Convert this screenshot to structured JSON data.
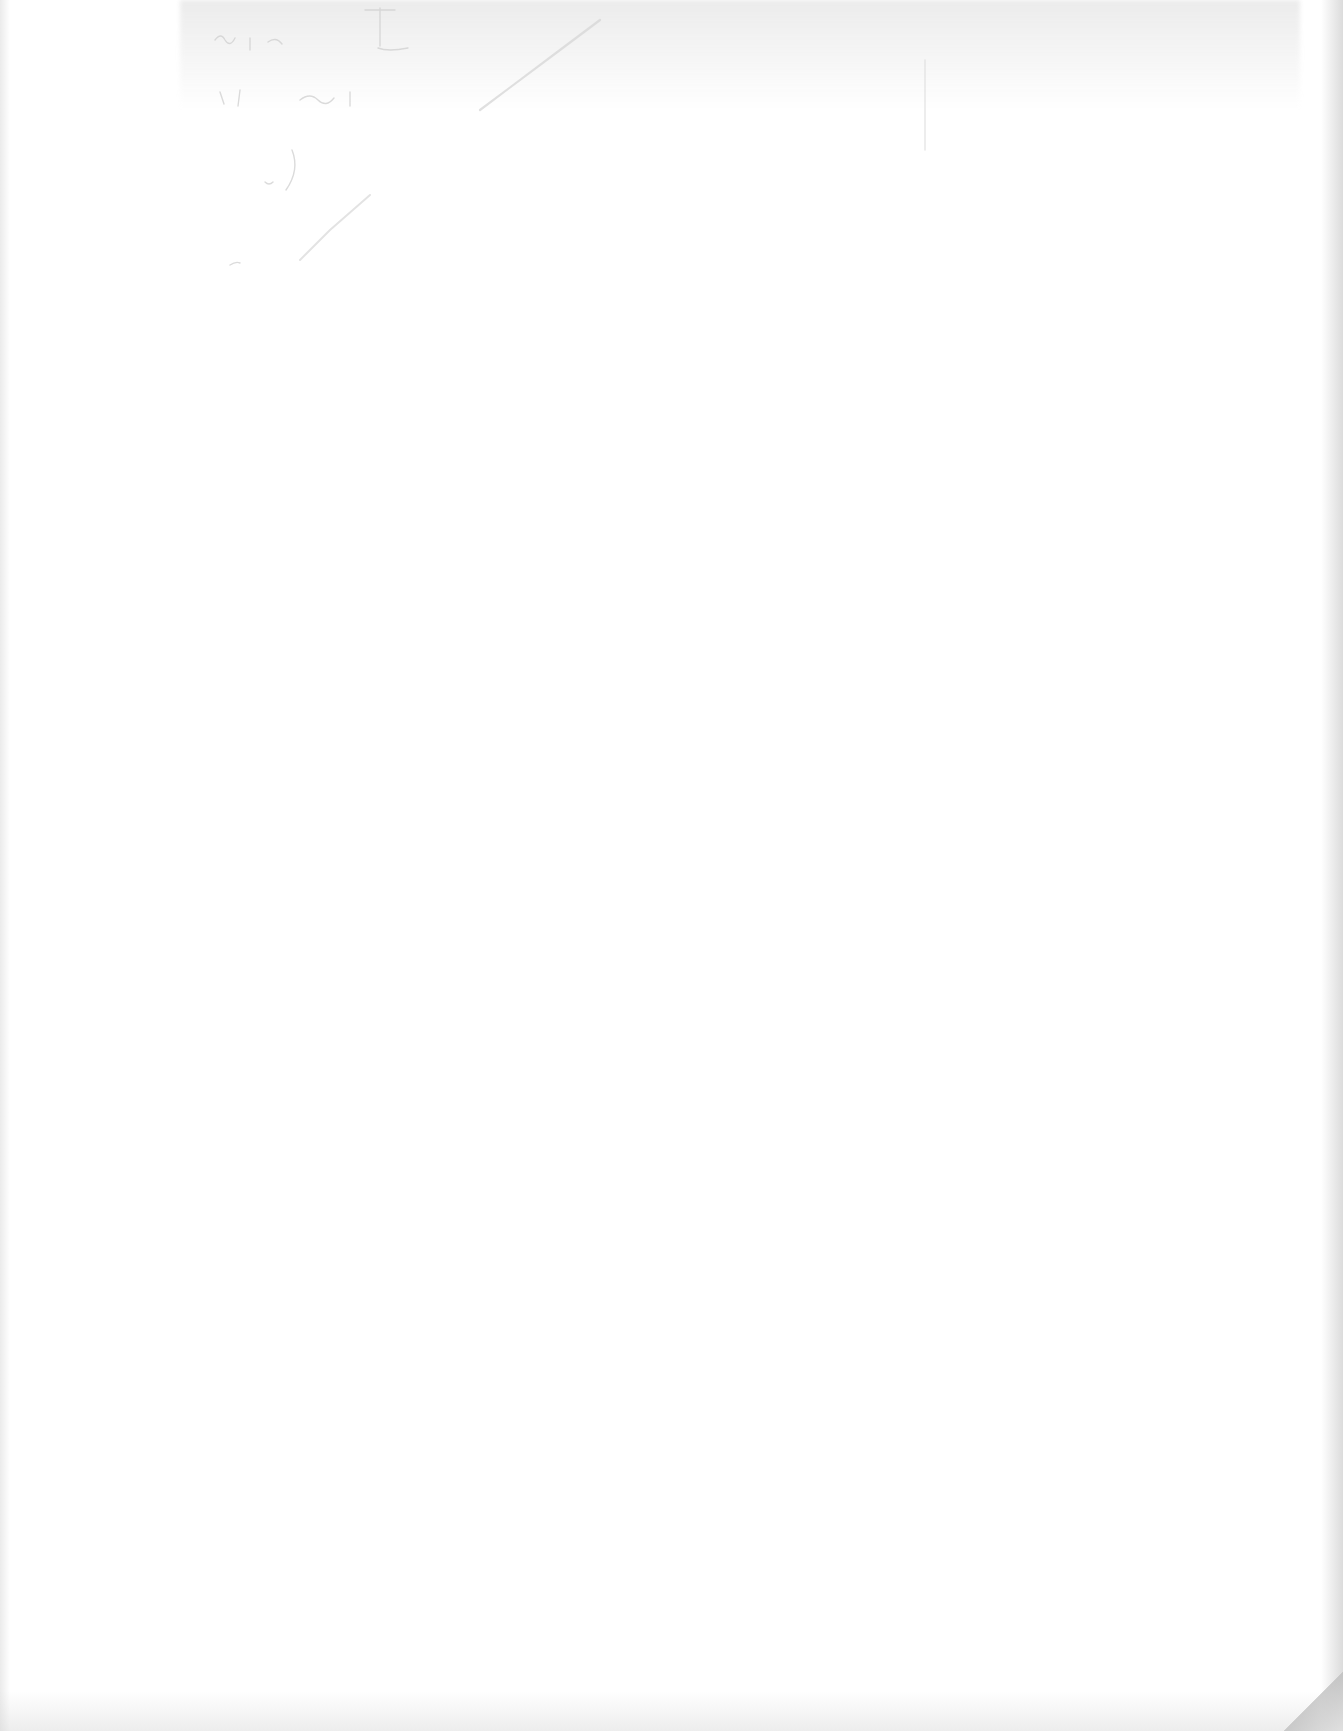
{
  "document": {
    "type": "blank scanned page",
    "visible_text": [],
    "notes": "Faint illegible pencil bleed-through near the top edge; no readable content"
  },
  "colors": {
    "paper": "#ffffff",
    "edge_shadow": "#bebebe",
    "bleed_marks": "#c8c8c8"
  }
}
